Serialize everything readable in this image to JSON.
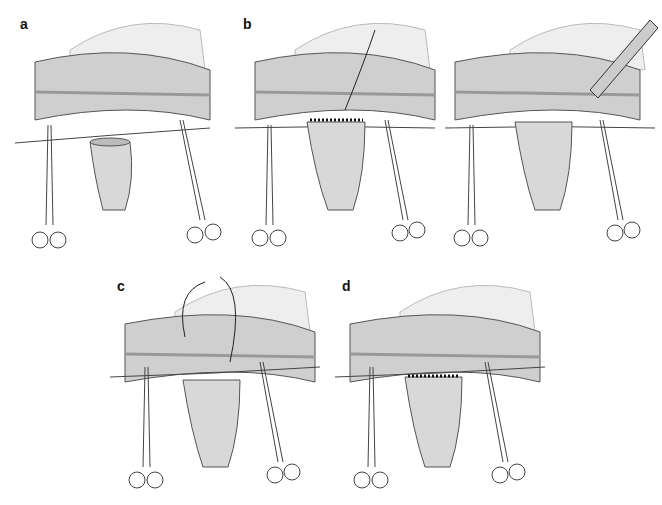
{
  "figure": {
    "panels": [
      {
        "id": "a",
        "label": "a",
        "description": "Colon segment with mesentery, stay sutures and clamps; open bowel stump below"
      },
      {
        "id": "b1",
        "label": "b",
        "description": "Posterior row of sutures placed; needle and suture through colon wall"
      },
      {
        "id": "b2",
        "label": "",
        "description": "Colotomy opened with electrocautery instrument"
      },
      {
        "id": "c",
        "label": "c",
        "description": "Anterior wall closure with running suture"
      },
      {
        "id": "d",
        "label": "d",
        "description": "Completed end-to-side anastomosis"
      }
    ]
  }
}
